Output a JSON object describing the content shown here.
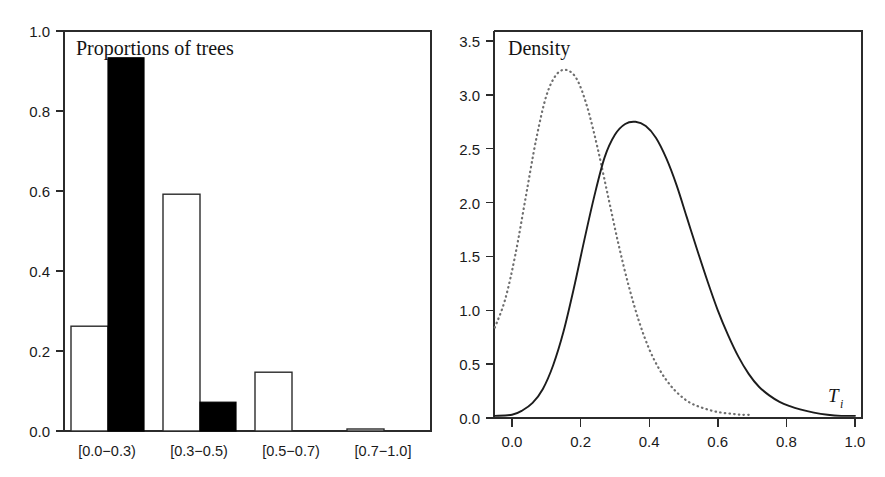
{
  "figure": {
    "background": "#ffffff",
    "ink_color": "#1a1a1a"
  },
  "chart_data": [
    {
      "id": "proportions-of-trees",
      "type": "bar",
      "title": "Proportions of trees",
      "xlabel": "",
      "ylabel": "",
      "ylim": [
        0.0,
        1.0
      ],
      "ytick_labels": [
        "0.0",
        "0.2",
        "0.4",
        "0.6",
        "0.8",
        "1.0"
      ],
      "ytick_values": [
        0.0,
        0.2,
        0.4,
        0.6,
        0.8,
        1.0
      ],
      "grid": false,
      "legend": "none",
      "categories": [
        "[0.0−0.3)",
        "[0.3−0.5)",
        "[0.5−0.7)",
        "[0.7−1.0]"
      ],
      "series": [
        {
          "name": "open",
          "style": "white-filled outlined bar",
          "values": [
            0.262,
            0.592,
            0.147,
            0.005
          ]
        },
        {
          "name": "filled",
          "style": "black filled bar",
          "values": [
            0.933,
            0.072,
            0.0,
            0.0
          ]
        }
      ]
    },
    {
      "id": "density",
      "type": "line",
      "title": "Density",
      "xlabel": "T_i",
      "xlabel_base": "T",
      "xlabel_sub": "i",
      "ylabel": "",
      "xlim": [
        -0.05,
        1.02
      ],
      "ylim": [
        -0.05,
        3.62
      ],
      "xtick_labels": [
        "0.0",
        "0.2",
        "0.4",
        "0.6",
        "0.8",
        "1.0"
      ],
      "xtick_values": [
        0.0,
        0.2,
        0.4,
        0.6,
        0.8,
        1.0
      ],
      "ytick_labels": [
        "0.0",
        "0.5",
        "1.0",
        "1.5",
        "2.0",
        "2.5",
        "3.0",
        "3.5"
      ],
      "ytick_values": [
        0.0,
        0.5,
        1.0,
        1.5,
        2.0,
        2.5,
        3.0,
        3.5
      ],
      "grid": false,
      "legend": "none",
      "series": [
        {
          "name": "solid-density",
          "style": "solid",
          "peak": {
            "x": 0.36,
            "y": 2.75
          },
          "x": [
            -0.05,
            0.0,
            0.03,
            0.06,
            0.09,
            0.12,
            0.15,
            0.18,
            0.21,
            0.24,
            0.27,
            0.3,
            0.33,
            0.36,
            0.39,
            0.42,
            0.45,
            0.48,
            0.51,
            0.54,
            0.57,
            0.6,
            0.63,
            0.66,
            0.69,
            0.72,
            0.75,
            0.78,
            0.81,
            0.84,
            0.88,
            0.92,
            0.96,
            1.0
          ],
          "y": [
            0.02,
            0.03,
            0.07,
            0.14,
            0.27,
            0.49,
            0.8,
            1.2,
            1.64,
            2.06,
            2.42,
            2.63,
            2.73,
            2.75,
            2.71,
            2.6,
            2.41,
            2.16,
            1.86,
            1.56,
            1.27,
            1.0,
            0.77,
            0.57,
            0.41,
            0.29,
            0.21,
            0.15,
            0.11,
            0.08,
            0.05,
            0.03,
            0.02,
            0.02
          ]
        },
        {
          "name": "dotted-density",
          "style": "dotted",
          "peak": {
            "x": 0.16,
            "y": 3.23
          },
          "x": [
            -0.05,
            -0.02,
            0.01,
            0.04,
            0.07,
            0.1,
            0.13,
            0.16,
            0.19,
            0.22,
            0.25,
            0.28,
            0.31,
            0.34,
            0.37,
            0.4,
            0.43,
            0.46,
            0.49,
            0.52,
            0.55,
            0.58,
            0.61,
            0.64,
            0.67,
            0.7
          ],
          "y": [
            0.84,
            1.1,
            1.52,
            2.05,
            2.58,
            2.99,
            3.19,
            3.23,
            3.14,
            2.88,
            2.5,
            2.06,
            1.62,
            1.23,
            0.9,
            0.64,
            0.45,
            0.31,
            0.21,
            0.14,
            0.1,
            0.07,
            0.05,
            0.04,
            0.03,
            0.03
          ]
        }
      ]
    }
  ],
  "left_panel": {
    "title": "Proportions of trees",
    "ytick_labels": [
      "1.0",
      "0.8",
      "0.6",
      "0.4",
      "0.2",
      "0.0"
    ],
    "category_labels": [
      "[0.0−0.3)",
      "[0.3−0.5)",
      "[0.5−0.7)",
      "[0.7−1.0]"
    ]
  },
  "right_panel": {
    "title": "Density",
    "ytick_labels": [
      "3.5",
      "3.0",
      "2.5",
      "2.0",
      "1.5",
      "1.0",
      "0.5",
      "0.0"
    ],
    "xtick_labels": [
      "0.0",
      "0.2",
      "0.4",
      "0.6",
      "0.8",
      "1.0"
    ],
    "axis_name_base": "T",
    "axis_name_sub": "i"
  }
}
